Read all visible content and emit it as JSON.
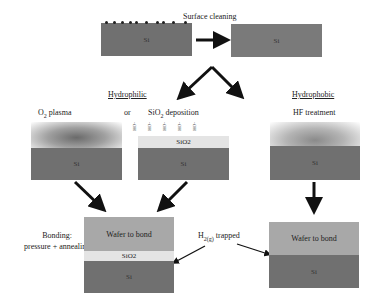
{
  "title": "Surface cleaning",
  "steps": {
    "cleaning": {
      "label": "Surface cleaning",
      "before_wafer": "Si",
      "after_wafer": "Si"
    },
    "hydrophilic": {
      "heading": "Hydrophilic",
      "option_a": {
        "label_prefix": "O",
        "label_sub": "2",
        "label_suffix": " plasma",
        "wafer": "Si"
      },
      "or_label": "or",
      "option_b": {
        "label_prefix": "SiO",
        "label_sub": "2",
        "label_suffix": " deposition",
        "oxide": "SiO2",
        "wafer": "Si",
        "surface_groups": [
          "-OH",
          "-OH",
          "-OH",
          "-OH",
          "-OH"
        ]
      }
    },
    "hydrophobic": {
      "heading": "Hydrophobic",
      "treatment": "HF treatment",
      "wafer": "Si"
    },
    "bonding": {
      "label_line1": "Bonding:",
      "label_line2": "pressure + annealing",
      "hydrophilic_stack": {
        "top": "Wafer to bond",
        "middle": "SiO2",
        "bottom": "Si"
      },
      "trapped_label_prefix": "H",
      "trapped_label_sub": "2(g)",
      "trapped_label_suffix": " trapped",
      "hydrophobic_stack": {
        "top": "Wafer to bond",
        "bottom": "Si"
      }
    }
  },
  "colors": {
    "si": "#707070",
    "wafer_to_bond": "#a8a8a8",
    "oxide": "#e4e4e4",
    "arrow": "#111111"
  }
}
